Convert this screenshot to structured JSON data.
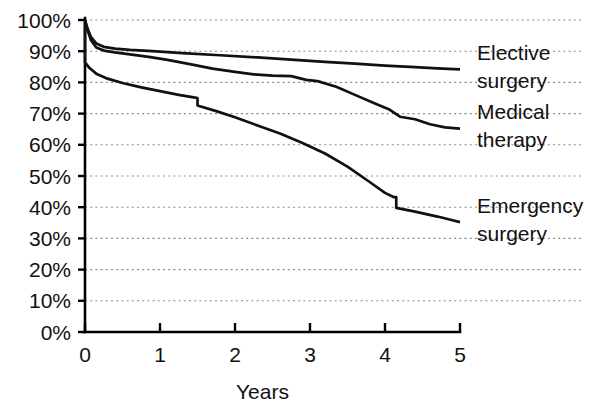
{
  "chart_data": {
    "type": "line",
    "title": "",
    "subtitle": "",
    "xlabel": "Years",
    "ylabel": "",
    "xlim": [
      0,
      5
    ],
    "ylim": [
      0,
      100
    ],
    "grid": true,
    "grid_axis": "y",
    "legend_position": "right-inline",
    "x_ticks": [
      "0",
      "1",
      "2",
      "3",
      "4",
      "5"
    ],
    "x_tick_values": [
      0,
      1,
      2,
      3,
      4,
      5
    ],
    "y_ticks": [
      "0%",
      "10%",
      "20%",
      "30%",
      "40%",
      "50%",
      "60%",
      "70%",
      "80%",
      "90%",
      "100%"
    ],
    "y_tick_values": [
      0,
      10,
      20,
      30,
      40,
      50,
      60,
      70,
      80,
      90,
      100
    ],
    "series": [
      {
        "name": "Elective surgery",
        "label_lines": [
          "Elective",
          "surgery"
        ],
        "color": "#111111",
        "end_value": 84,
        "x": [
          0.0,
          0.03,
          0.08,
          0.15,
          0.25,
          0.4,
          0.6,
          0.9,
          1.3,
          1.8,
          2.3,
          2.8,
          3.2,
          3.6,
          4.0,
          4.4,
          4.7,
          5.0
        ],
        "values": [
          100,
          97.5,
          94.5,
          92.5,
          91.4,
          90.8,
          90.4,
          90.0,
          89.4,
          88.7,
          88.0,
          87.2,
          86.6,
          86.0,
          85.4,
          84.9,
          84.5,
          84.2
        ]
      },
      {
        "name": "Medical therapy",
        "label_lines": [
          "Medical",
          "therapy"
        ],
        "color": "#111111",
        "end_value": 65,
        "x": [
          0.0,
          0.03,
          0.08,
          0.15,
          0.25,
          0.4,
          0.6,
          0.85,
          1.1,
          1.45,
          1.7,
          2.0,
          2.25,
          2.5,
          2.75,
          2.95,
          3.1,
          3.35,
          3.6,
          3.85,
          4.05,
          4.2,
          4.4,
          4.6,
          4.8,
          5.0
        ],
        "values": [
          100,
          97.0,
          93.5,
          91.2,
          90.2,
          89.6,
          89.0,
          88.2,
          87.2,
          85.6,
          84.4,
          83.4,
          82.6,
          82.2,
          82.0,
          80.8,
          80.4,
          78.6,
          76.0,
          73.4,
          71.4,
          69.0,
          68.2,
          66.6,
          65.6,
          65.2
        ]
      },
      {
        "name": "Emergency surgery",
        "label_lines": [
          "Emergency",
          "surgery"
        ],
        "color": "#111111",
        "end_value": 35,
        "x": [
          0.0,
          0.0,
          0.06,
          0.15,
          0.3,
          0.5,
          0.75,
          1.0,
          1.25,
          1.45,
          1.5,
          1.5,
          1.75,
          2.0,
          2.3,
          2.6,
          2.9,
          3.2,
          3.5,
          3.8,
          4.0,
          4.12,
          4.15,
          4.15,
          4.4,
          4.7,
          4.9,
          5.0
        ],
        "values": [
          100,
          86.4,
          84.6,
          82.8,
          81.2,
          79.8,
          78.4,
          77.2,
          76.0,
          75.2,
          75.0,
          72.6,
          70.8,
          68.8,
          66.2,
          63.6,
          60.6,
          57.2,
          53.0,
          48.0,
          44.6,
          43.2,
          43.2,
          39.8,
          38.6,
          37.0,
          35.8,
          35.2
        ]
      }
    ]
  },
  "axis": {
    "x_title": "Years"
  }
}
